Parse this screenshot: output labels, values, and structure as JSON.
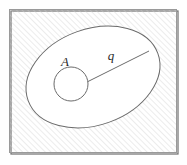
{
  "figure": {
    "domain": "Diagram",
    "kind": "set-diagram",
    "width": 187,
    "height": 165,
    "background_color": "#ffffff"
  },
  "frame": {
    "name": "outer-frame",
    "x": 9.5,
    "y": 9.5,
    "width": 167,
    "height": 143,
    "stroke_color": "#9a9a9a",
    "stroke_width": 1,
    "shadow_color": "#6e6e6e",
    "fill_color": "#ffffff"
  },
  "hatch": {
    "name": "diagonal-hatch-pattern",
    "angle_degrees": 45,
    "direction": "bottom-left-to-top-right",
    "spacing": 4,
    "line_color": "#cfcfcf",
    "line_width": 0.8
  },
  "ellipse": {
    "name": "region-boundary-ellipse",
    "center_x": 93,
    "center_y": 77,
    "radius_x": 69,
    "radius_y": 48,
    "rotation_degrees": -20,
    "stroke_color": "#6b6b6b",
    "stroke_width": 1,
    "fill_color": "#ffffff"
  },
  "circle": {
    "name": "inner-hole-circle",
    "label": "A",
    "center_x": 71,
    "center_y": 84,
    "radius": 17,
    "stroke_color": "#6b6b6b",
    "stroke_width": 1,
    "fill_color": "#ffffff"
  },
  "radius_line": {
    "name": "radius-segment",
    "label": "q",
    "x1": 87,
    "y1": 82,
    "x2": 149,
    "y2": 51,
    "stroke_color": "#6b6b6b",
    "stroke_width": 1
  },
  "labels": [
    {
      "name": "label-A",
      "text": "A",
      "x": 65,
      "y": 66,
      "font_size": 13,
      "style": "italic",
      "color": "#2b2b2b"
    },
    {
      "name": "label-q",
      "text": "q",
      "x": 111,
      "y": 60,
      "font_size": 13,
      "style": "italic",
      "color": "#2b2b2b"
    }
  ]
}
